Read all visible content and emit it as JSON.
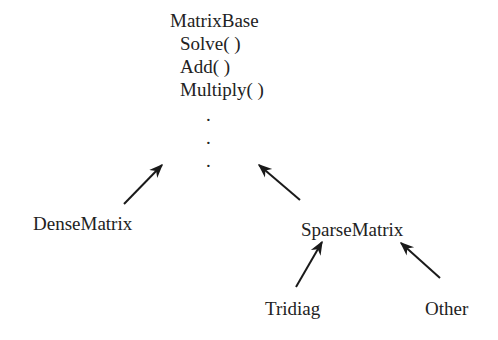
{
  "base_class": {
    "name": "MatrixBase",
    "methods": [
      "Solve( )",
      "Add( )",
      "Multiply( )"
    ],
    "ellipsis": [
      ".",
      ".",
      "."
    ]
  },
  "derived": {
    "dense": "DenseMatrix",
    "sparse": "SparseMatrix",
    "sparse_children": [
      "Tridiag",
      "Other"
    ]
  },
  "colors": {
    "text": "#222222",
    "arrow": "#1a1a1a",
    "background": "#ffffff"
  }
}
